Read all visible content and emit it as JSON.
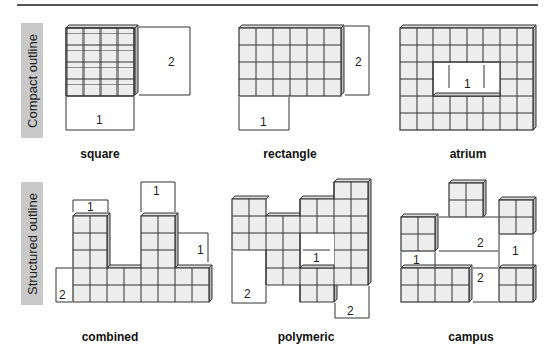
{
  "rows": [
    {
      "label": "Compact outline",
      "items": [
        {
          "caption": "square",
          "dims": [
            "1",
            "2"
          ]
        },
        {
          "caption": "rectangle",
          "dims": [
            "1",
            "2"
          ]
        },
        {
          "caption": "atrium",
          "dims": [
            "1"
          ]
        }
      ]
    },
    {
      "label": "Structured outline",
      "items": [
        {
          "caption": "combined",
          "dims": [
            "1",
            "1",
            "1",
            "2"
          ]
        },
        {
          "caption": "polymeric",
          "dims": [
            "1",
            "2",
            "2"
          ]
        },
        {
          "caption": "campus",
          "dims": [
            "1",
            "2",
            "1",
            "2"
          ]
        }
      ]
    }
  ],
  "colors": {
    "cell_fill": "#ededed",
    "line": "#333333",
    "label_bg": "#c9c9c9"
  }
}
